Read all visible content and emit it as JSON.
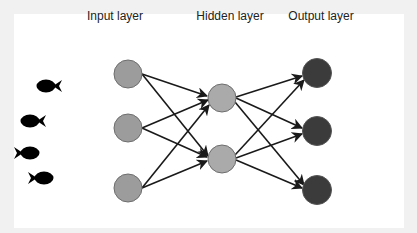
{
  "labels": {
    "input": "Input layer",
    "hidden": "Hidden layer",
    "output": "Output layer"
  },
  "colors": {
    "background_frame": "#f1f1f1",
    "panel": "#ffffff",
    "input_node_fill": "#9c9c9c",
    "hidden_node_fill": "#aaaaaa",
    "output_node_fill": "#3b3b3b",
    "node_stroke": "#6e6e6e",
    "edge": "#1a1a1a",
    "fish": "#000000"
  },
  "diagram": {
    "layers": [
      {
        "name": "input",
        "node_count": 3
      },
      {
        "name": "hidden",
        "node_count": 2
      },
      {
        "name": "output",
        "node_count": 3
      }
    ],
    "connections": "fully connected, directed left to right",
    "fish_icons": [
      {
        "facing": "left"
      },
      {
        "facing": "left"
      },
      {
        "facing": "right"
      },
      {
        "facing": "right"
      }
    ]
  }
}
